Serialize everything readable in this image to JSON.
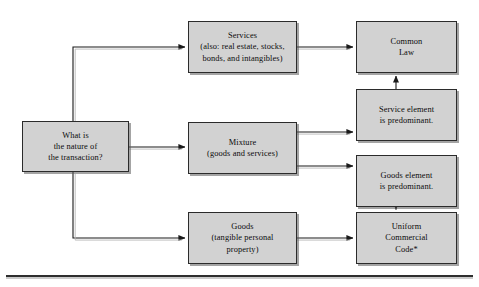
{
  "diagram": {
    "colors": {
      "node_fill": "#d2d2d2",
      "node_border": "#2b2b2b",
      "connector": "#1e1e1e",
      "background": "#ffffff"
    },
    "nodes": [
      {
        "id": "question",
        "label": "What is\nthe nature of\nthe transaction?"
      },
      {
        "id": "services",
        "label": "Services\n(also: real estate, stocks,\nbonds, and intangibles)"
      },
      {
        "id": "mixture",
        "label": "Mixture\n(goods and services)"
      },
      {
        "id": "goods",
        "label": "Goods\n(tangible personal\nproperty)"
      },
      {
        "id": "common_law",
        "label": "Common\nLaw"
      },
      {
        "id": "service_element",
        "label": "Service element\nis predominant."
      },
      {
        "id": "goods_element",
        "label": "Goods element\nis predominant."
      },
      {
        "id": "ucc",
        "label": "Uniform\nCommercial\nCode*"
      }
    ],
    "edges": [
      {
        "id": "question-to-services",
        "from": "question",
        "to": "services",
        "route": "up-then-right"
      },
      {
        "id": "question-to-mixture",
        "from": "question",
        "to": "mixture",
        "route": "straight-right"
      },
      {
        "id": "question-to-goods",
        "from": "question",
        "to": "goods",
        "route": "down-then-right"
      },
      {
        "id": "services-to-common-law",
        "from": "services",
        "to": "common_law",
        "route": "straight-right"
      },
      {
        "id": "mixture-to-service-element",
        "from": "mixture",
        "to": "service_element",
        "route": "straight-right"
      },
      {
        "id": "mixture-to-goods-element",
        "from": "mixture",
        "to": "goods_element",
        "route": "straight-right"
      },
      {
        "id": "goods-to-ucc",
        "from": "goods",
        "to": "ucc",
        "route": "straight-right"
      },
      {
        "id": "service-element-to-common-law",
        "from": "service_element",
        "to": "common_law",
        "route": "straight-up"
      },
      {
        "id": "goods-element-to-ucc",
        "from": "goods_element",
        "to": "ucc",
        "route": "straight-down"
      }
    ],
    "footnote_marker": "*"
  }
}
